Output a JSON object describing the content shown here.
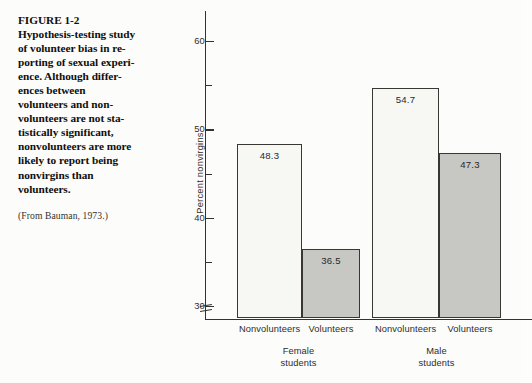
{
  "caption": {
    "lines": [
      "FIGURE 1-2",
      "Hypothesis-testing study",
      "of volunteer bias in re-",
      "porting of sexual experi-",
      "ence. Although differ-",
      "ences between",
      "volunteers and non-",
      "volunteers are not sta-",
      "tistically significant,",
      "nonvolunteers are more",
      "likely to report being",
      "nonvirgins than",
      "volunteers."
    ],
    "source": "(From Bauman, 1973.)"
  },
  "chart_data": {
    "type": "bar",
    "title": "",
    "xlabel": "",
    "ylabel": "Percent nonvirgins",
    "ylim": [
      28.5,
      62.5
    ],
    "yticks_major": [
      30,
      40,
      50,
      60
    ],
    "yticks_major_labels": [
      "30",
      "40",
      "50",
      "60"
    ],
    "yticks_minor": [
      35,
      45,
      55
    ],
    "axis_break": true,
    "grid": false,
    "legend": "none",
    "categories": [
      "Nonvolunteers",
      "Volunteers",
      "Nonvolunteers",
      "Volunteers"
    ],
    "values": [
      48.3,
      36.5,
      54.7,
      47.3
    ],
    "value_labels": [
      "48.3",
      "36.5",
      "54.7",
      "47.3"
    ],
    "bar_styles": [
      "white",
      "gray",
      "white",
      "gray"
    ],
    "groups": [
      {
        "label_lines": [
          "Female",
          "students"
        ]
      },
      {
        "label_lines": [
          "Male",
          "students"
        ]
      }
    ],
    "colors": {
      "white_bar": "#f7f7f4",
      "gray_bar": "#c7c7c4",
      "outline": "#3a3733",
      "text": "#2f2c29"
    }
  }
}
